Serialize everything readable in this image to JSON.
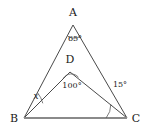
{
  "figure": {
    "type": "geometry-diagram",
    "width": 146,
    "height": 136,
    "background_color": "#ffffff",
    "line_color": "#4a4a4a",
    "base_line_color": "#8a8a8a"
  },
  "points": {
    "A": {
      "label": "A",
      "x": 73,
      "y": 25,
      "label_x": 73,
      "label_y": 16
    },
    "B": {
      "label": "B",
      "x": 24,
      "y": 118,
      "label_x": 14,
      "label_y": 122
    },
    "C": {
      "label": "C",
      "x": 127,
      "y": 118,
      "label_x": 136,
      "label_y": 122
    },
    "D": {
      "label": "D",
      "x": 70,
      "y": 72,
      "label_x": 70,
      "label_y": 63
    }
  },
  "segments": [
    {
      "name": "AB",
      "from": "A",
      "to": "B",
      "style": "thin"
    },
    {
      "name": "AC",
      "from": "A",
      "to": "C",
      "style": "thin"
    },
    {
      "name": "BC",
      "from": "B",
      "to": "C",
      "style": "base"
    },
    {
      "name": "DB",
      "from": "D",
      "to": "B",
      "style": "thin"
    },
    {
      "name": "DC",
      "from": "D",
      "to": "C",
      "style": "thin"
    }
  ],
  "angles": [
    {
      "name": "angle-at-A",
      "vertex": "A",
      "value": "65",
      "unit": "°",
      "label": "65°",
      "label_x": 75,
      "label_y": 41
    },
    {
      "name": "angle-at-D",
      "vertex": "D",
      "value": "100",
      "unit": "°",
      "label": "100°",
      "label_x": 72,
      "label_y": 88
    },
    {
      "name": "angle-DCB",
      "vertex": "C",
      "value": "15",
      "unit": "°",
      "label": "15°",
      "label_x": 120,
      "label_y": 87
    },
    {
      "name": "angle-ABD",
      "vertex": "B",
      "value": "x",
      "unit": "",
      "label": "x",
      "label_x": 36,
      "label_y": 99
    }
  ]
}
